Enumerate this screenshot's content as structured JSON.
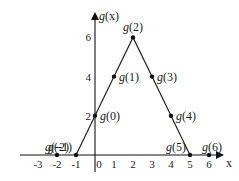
{
  "chart_data": {
    "type": "line",
    "title": "",
    "xlabel": "x",
    "ylabel": "g(x)",
    "xlim": [
      -3,
      6
    ],
    "ylim": [
      0,
      6
    ],
    "grid": false,
    "x_ticks": [
      "-3",
      "-2",
      "-1",
      "0",
      "1",
      "2",
      "3",
      "4",
      "5",
      "6"
    ],
    "y_ticks": [
      "2",
      "4",
      "6"
    ],
    "series": [
      {
        "name": "g(x)",
        "x": [
          -2,
          -1,
          0,
          1,
          2,
          3,
          4,
          5,
          6
        ],
        "values": [
          0,
          0,
          2,
          4,
          6,
          4,
          2,
          0,
          0
        ]
      }
    ],
    "point_labels": [
      "g(-2)",
      "g(-1)",
      "g(0)",
      "g(1)",
      "g(2)",
      "g(3)",
      "g(4)",
      "g(5)",
      "g(6)"
    ]
  },
  "axes": {
    "x_label": "x",
    "y_label_prefix": "g",
    "y_label_arg": "(x)"
  }
}
